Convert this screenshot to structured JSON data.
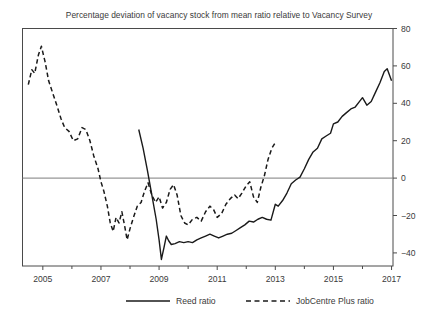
{
  "chart_data": {
    "type": "line",
    "title": "Percentage deviation of vacancy stock from mean ratio relative to Vacancy Survey",
    "xlabel": "",
    "ylabel": "",
    "xlim": [
      2004.3,
      2017.05
    ],
    "ylim": [
      -47,
      80
    ],
    "grid": false,
    "y_axis_side": "right",
    "zero_line": 0,
    "xticks": [
      2005,
      2007,
      2009,
      2011,
      2013,
      2015,
      2017
    ],
    "xtick_labels": [
      "2005",
      "2007",
      "2009",
      "2011",
      "2013",
      "2015",
      "2017"
    ],
    "xminor_ticks": [
      2004,
      2006,
      2008,
      2010,
      2012,
      2014,
      2016
    ],
    "yticks": [
      -40,
      -20,
      0,
      20,
      40,
      60,
      80
    ],
    "ytick_labels": [
      "−40",
      "−20",
      "0",
      "20",
      "40",
      "60",
      "80"
    ],
    "legend_position": "below",
    "series": [
      {
        "name": "Reed ratio",
        "style": "solid",
        "color": "#1a1a1a",
        "points": [
          [
            2008.3,
            26.0
          ],
          [
            2008.45,
            16.0
          ],
          [
            2008.6,
            4.0
          ],
          [
            2008.75,
            -9.0
          ],
          [
            2008.9,
            -22.0
          ],
          [
            2009.0,
            -33.0
          ],
          [
            2009.08,
            -43.5
          ],
          [
            2009.17,
            -37.0
          ],
          [
            2009.25,
            -31.0
          ],
          [
            2009.33,
            -33.5
          ],
          [
            2009.42,
            -35.5
          ],
          [
            2009.55,
            -35.0
          ],
          [
            2009.7,
            -34.0
          ],
          [
            2009.85,
            -34.5
          ],
          [
            2010.0,
            -34.0
          ],
          [
            2010.15,
            -34.5
          ],
          [
            2010.3,
            -33.0
          ],
          [
            2010.45,
            -32.0
          ],
          [
            2010.6,
            -31.0
          ],
          [
            2010.75,
            -30.0
          ],
          [
            2010.9,
            -31.0
          ],
          [
            2011.05,
            -32.0
          ],
          [
            2011.2,
            -31.0
          ],
          [
            2011.35,
            -30.0
          ],
          [
            2011.5,
            -29.5
          ],
          [
            2011.65,
            -28.0
          ],
          [
            2011.8,
            -26.5
          ],
          [
            2011.95,
            -25.0
          ],
          [
            2012.1,
            -23.0
          ],
          [
            2012.25,
            -23.5
          ],
          [
            2012.4,
            -22.0
          ],
          [
            2012.55,
            -21.0
          ],
          [
            2012.7,
            -22.0
          ],
          [
            2012.85,
            -22.5
          ],
          [
            2013.0,
            -14.0
          ],
          [
            2013.1,
            -15.0
          ],
          [
            2013.25,
            -12.0
          ],
          [
            2013.4,
            -8.0
          ],
          [
            2013.55,
            -3.0
          ],
          [
            2013.7,
            -1.0
          ],
          [
            2013.85,
            0.5
          ],
          [
            2014.0,
            5.0
          ],
          [
            2014.15,
            10.0
          ],
          [
            2014.3,
            14.0
          ],
          [
            2014.45,
            16.0
          ],
          [
            2014.6,
            21.0
          ],
          [
            2014.75,
            22.5
          ],
          [
            2014.9,
            24.0
          ],
          [
            2015.0,
            29.0
          ],
          [
            2015.15,
            30.0
          ],
          [
            2015.3,
            33.0
          ],
          [
            2015.45,
            35.0
          ],
          [
            2015.6,
            37.0
          ],
          [
            2015.75,
            38.0
          ],
          [
            2015.9,
            41.0
          ],
          [
            2016.0,
            43.0
          ],
          [
            2016.15,
            39.0
          ],
          [
            2016.3,
            41.0
          ],
          [
            2016.45,
            46.0
          ],
          [
            2016.6,
            51.0
          ],
          [
            2016.75,
            57.0
          ],
          [
            2016.85,
            58.5
          ],
          [
            2017.0,
            52.0
          ]
        ]
      },
      {
        "name": "JobCentre Plus ratio",
        "style": "dashed",
        "color": "#1a1a1a",
        "points": [
          [
            2004.5,
            50.0
          ],
          [
            2004.62,
            58.0
          ],
          [
            2004.72,
            56.0
          ],
          [
            2004.85,
            66.0
          ],
          [
            2004.95,
            70.5
          ],
          [
            2005.08,
            62.0
          ],
          [
            2005.2,
            52.0
          ],
          [
            2005.35,
            45.0
          ],
          [
            2005.5,
            38.0
          ],
          [
            2005.62,
            32.0
          ],
          [
            2005.75,
            27.0
          ],
          [
            2005.9,
            25.0
          ],
          [
            2006.05,
            20.0
          ],
          [
            2006.2,
            21.0
          ],
          [
            2006.35,
            27.0
          ],
          [
            2006.48,
            26.0
          ],
          [
            2006.62,
            20.0
          ],
          [
            2006.75,
            12.0
          ],
          [
            2006.9,
            5.0
          ],
          [
            2007.0,
            -2.0
          ],
          [
            2007.1,
            -7.0
          ],
          [
            2007.22,
            -15.0
          ],
          [
            2007.32,
            -24.0
          ],
          [
            2007.42,
            -28.5
          ],
          [
            2007.52,
            -21.0
          ],
          [
            2007.62,
            -24.0
          ],
          [
            2007.72,
            -18.0
          ],
          [
            2007.82,
            -26.0
          ],
          [
            2007.9,
            -33.0
          ],
          [
            2008.0,
            -27.0
          ],
          [
            2008.12,
            -21.0
          ],
          [
            2008.25,
            -15.0
          ],
          [
            2008.38,
            -13.0
          ],
          [
            2008.5,
            -7.0
          ],
          [
            2008.62,
            -2.5
          ],
          [
            2008.75,
            -9.0
          ],
          [
            2008.88,
            -13.0
          ],
          [
            2009.0,
            -10.0
          ],
          [
            2009.12,
            -16.0
          ],
          [
            2009.25,
            -13.0
          ],
          [
            2009.38,
            -6.0
          ],
          [
            2009.5,
            -3.5
          ],
          [
            2009.62,
            -9.0
          ],
          [
            2009.75,
            -20.0
          ],
          [
            2009.88,
            -24.0
          ],
          [
            2010.0,
            -25.0
          ],
          [
            2010.15,
            -22.0
          ],
          [
            2010.3,
            -21.0
          ],
          [
            2010.45,
            -23.0
          ],
          [
            2010.6,
            -18.0
          ],
          [
            2010.75,
            -15.0
          ],
          [
            2010.88,
            -17.0
          ],
          [
            2011.0,
            -21.0
          ],
          [
            2011.15,
            -19.0
          ],
          [
            2011.3,
            -14.0
          ],
          [
            2011.45,
            -11.0
          ],
          [
            2011.6,
            -9.0
          ],
          [
            2011.72,
            -11.0
          ],
          [
            2011.85,
            -8.0
          ],
          [
            2012.0,
            -4.0
          ],
          [
            2012.12,
            -2.0
          ],
          [
            2012.25,
            -10.0
          ],
          [
            2012.38,
            -13.0
          ],
          [
            2012.5,
            -5.0
          ],
          [
            2012.62,
            1.0
          ],
          [
            2012.75,
            10.0
          ],
          [
            2012.88,
            16.0
          ],
          [
            2013.0,
            19.0
          ]
        ]
      }
    ]
  },
  "legend": {
    "items": [
      {
        "label": "Reed ratio",
        "style": "solid"
      },
      {
        "label": "JobCentre Plus ratio",
        "style": "dashed"
      }
    ]
  }
}
